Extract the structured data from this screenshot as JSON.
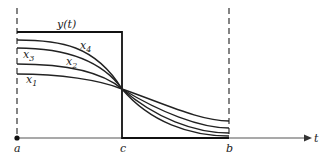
{
  "diagram": {
    "type": "function-approximation-plot",
    "colors": {
      "ink": "#222222",
      "axis": "#555555",
      "background": "#ffffff"
    },
    "axis": {
      "label": "t"
    },
    "points": {
      "a": {
        "label": "a"
      },
      "c": {
        "label": "c"
      },
      "b": {
        "label": "b"
      }
    },
    "step_function": {
      "label": "y(t)"
    },
    "curves": [
      {
        "id": "x1",
        "label": "x",
        "sub": "1"
      },
      {
        "id": "x2",
        "label": "x",
        "sub": "2"
      },
      {
        "id": "x3",
        "label": "x",
        "sub": "3"
      },
      {
        "id": "x4",
        "label": "x",
        "sub": "4"
      }
    ]
  }
}
